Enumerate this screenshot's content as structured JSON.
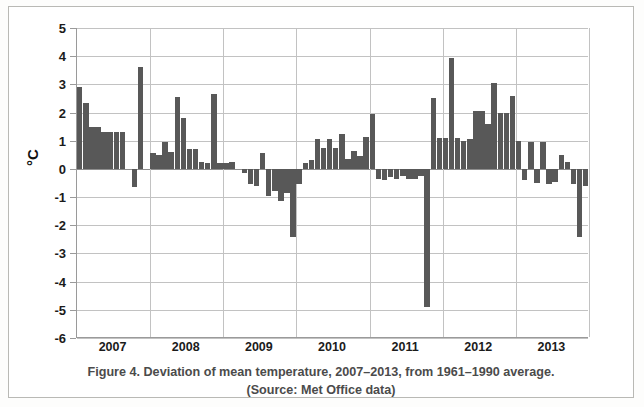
{
  "figure": {
    "caption_line1": "Figure 4. Deviation of mean temperature, 2007–2013, from 1961–1990 average.",
    "caption_line2": "(Source: Met Office data)"
  },
  "colors": {
    "bar": "#585858",
    "grid": "#c2c2c2",
    "axis": "#9a9a9a",
    "text": "#1b1b1b",
    "caption": "#4b4b4b",
    "background": "#ffffff"
  },
  "chart_data": {
    "type": "bar",
    "title": "Deviation of mean temperature, 2007–2013, from 1961–1990 average.",
    "subtitle": "(Source: Met Office data)",
    "source": "Met Office data",
    "xlabel": "",
    "ylabel": "°C",
    "ylim": [
      -6,
      5
    ],
    "ytick_labels": [
      "5",
      "4",
      "3",
      "2",
      "1",
      "0",
      "-1",
      "-2",
      "-3",
      "-4",
      "-5",
      "-6"
    ],
    "ytick_values": [
      5,
      4,
      3,
      2,
      1,
      0,
      -1,
      -2,
      -3,
      -4,
      -5,
      -6
    ],
    "xtick_labels": [
      "2007",
      "2008",
      "2009",
      "2010",
      "2011",
      "2012",
      "2013"
    ],
    "grid": true,
    "legend": false,
    "bar_count": 84,
    "categories": [
      "2007-01",
      "2007-02",
      "2007-03",
      "2007-04",
      "2007-05",
      "2007-06",
      "2007-07",
      "2007-08",
      "2007-09",
      "2007-10",
      "2007-11",
      "2007-12",
      "2008-01",
      "2008-02",
      "2008-03",
      "2008-04",
      "2008-05",
      "2008-06",
      "2008-07",
      "2008-08",
      "2008-09",
      "2008-10",
      "2008-11",
      "2008-12",
      "2009-01",
      "2009-02",
      "2009-03",
      "2009-04",
      "2009-05",
      "2009-06",
      "2009-07",
      "2009-08",
      "2009-09",
      "2009-10",
      "2009-11",
      "2009-12",
      "2010-01",
      "2010-02",
      "2010-03",
      "2010-04",
      "2010-05",
      "2010-06",
      "2010-07",
      "2010-08",
      "2010-09",
      "2010-10",
      "2010-11",
      "2010-12",
      "2011-01",
      "2011-02",
      "2011-03",
      "2011-04",
      "2011-05",
      "2011-06",
      "2011-07",
      "2011-08",
      "2011-09",
      "2011-10",
      "2011-11",
      "2011-12",
      "2012-01",
      "2012-02",
      "2012-03",
      "2012-04",
      "2012-05",
      "2012-06",
      "2012-07",
      "2012-08",
      "2012-09",
      "2012-10",
      "2012-11",
      "2012-12",
      "2013-01",
      "2013-02",
      "2013-03",
      "2013-04",
      "2013-05",
      "2013-06",
      "2013-07",
      "2013-08",
      "2013-09",
      "2013-10",
      "2013-11",
      "2013-12"
    ],
    "values": [
      2.9,
      2.35,
      1.5,
      1.5,
      1.3,
      1.3,
      1.3,
      1.3,
      0.0,
      -0.65,
      3.6,
      0.0,
      0.55,
      0.5,
      0.95,
      0.6,
      2.55,
      1.8,
      0.7,
      0.7,
      0.25,
      0.2,
      2.65,
      0.2,
      0.2,
      0.25,
      0.0,
      -0.15,
      -0.55,
      -0.6,
      0.55,
      -0.95,
      -0.8,
      -1.15,
      -0.85,
      -2.4,
      -0.55,
      0.2,
      0.3,
      1.05,
      0.75,
      1.05,
      0.75,
      1.25,
      0.35,
      0.65,
      0.45,
      1.15,
      1.95,
      -0.35,
      -0.4,
      -0.3,
      -0.35,
      -0.25,
      -0.35,
      -0.35,
      -0.25,
      -4.9,
      2.5,
      1.1,
      1.1,
      3.95,
      1.1,
      1.0,
      1.05,
      2.05,
      2.05,
      1.6,
      3.05,
      2.0,
      2.0,
      2.6,
      1.0,
      -0.4,
      0.95,
      -0.5,
      0.95,
      -0.55,
      -0.45,
      0.5,
      0.25,
      -0.55,
      -2.4,
      -0.6
    ]
  }
}
